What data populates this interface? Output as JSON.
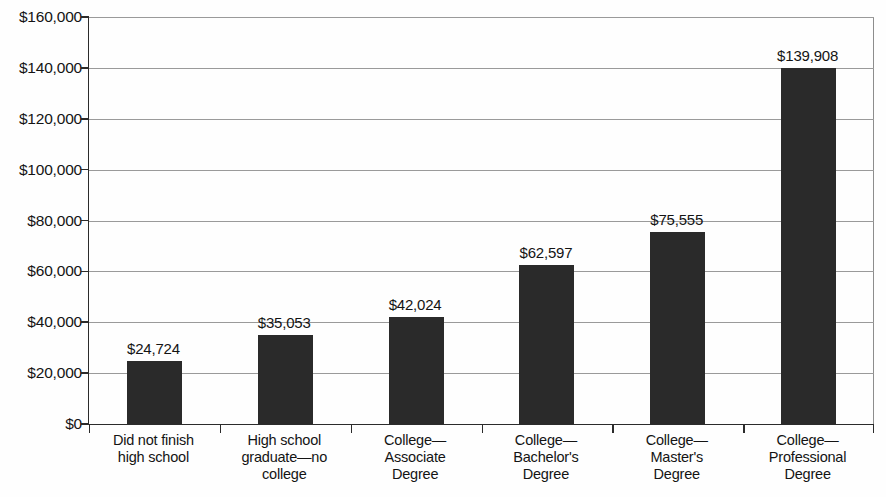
{
  "chart_data": {
    "type": "bar",
    "title": "",
    "subtitle": "",
    "xlabel": "",
    "ylabel": "",
    "categories": [
      "Did not finish\nhigh school",
      "High school\ngraduate—no\ncollege",
      "College—\nAssociate\nDegree",
      "College—\nBachelor's\nDegree",
      "College—\nMaster's\nDegree",
      "College—\nProfessional\nDegree"
    ],
    "values": [
      24724,
      35053,
      42024,
      62597,
      75555,
      139908
    ],
    "value_labels": [
      "$24,724",
      "$35,053",
      "$42,024",
      "$62,597",
      "$75,555",
      "$139,908"
    ],
    "ylim": [
      0,
      160000
    ],
    "ytick_values": [
      0,
      20000,
      40000,
      60000,
      80000,
      100000,
      120000,
      140000,
      160000
    ],
    "ytick_labels": [
      "$0",
      "$20,000",
      "$40,000",
      "$60,000",
      "$80,000",
      "$100,000",
      "$120,000",
      "$140,000",
      "$160,000"
    ],
    "grid": true,
    "legend": false,
    "legend_position": "none",
    "bar_color": "#2a2a2a",
    "grid_color": "#9a9a9a",
    "axis_color": "#2b2b2b",
    "background_color": "#fefefe"
  }
}
